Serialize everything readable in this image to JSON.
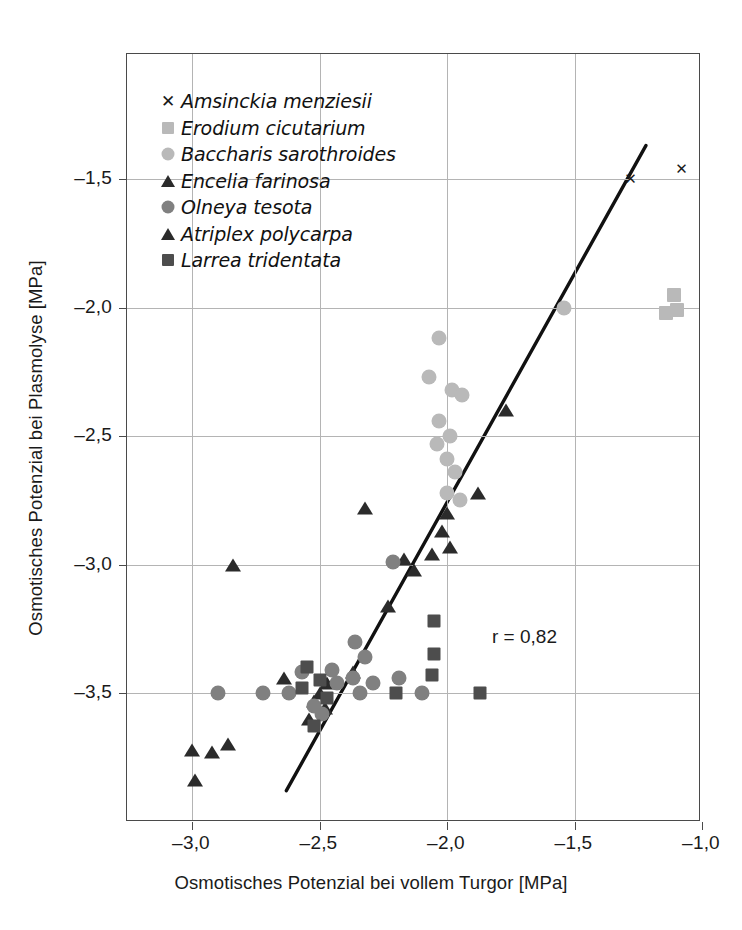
{
  "chart_data": {
    "type": "scatter",
    "title": "",
    "xlabel": "Osmotisches Potenzial bei vollem Turgor [MPa]",
    "ylabel": "Osmotisches Potenzial bei Plasmolyse [MPa]",
    "xlim": [
      -3.25,
      -1.0
    ],
    "ylim": [
      -3.95,
      -1.32
    ],
    "xticks": [
      -3.0,
      -2.5,
      -2.0,
      -1.5,
      -1.0
    ],
    "xticklabels": [
      "–3,0",
      "–2,5",
      "–2,0",
      "–1,5",
      "–1,0"
    ],
    "yticks": [
      -1.5,
      -2.0,
      -2.5,
      -3.0,
      -3.5
    ],
    "yticklabels": [
      "–1,5",
      "–2,0",
      "–2,5",
      "–3,0",
      "–3,5"
    ],
    "grid": true,
    "legend_position": "upper-left-inside",
    "annotations": [
      {
        "name": "correlation",
        "text": "r = 0,82",
        "x": -1.77,
        "y": -3.27
      }
    ],
    "trendline": {
      "name": "regression-line",
      "color": "#111111",
      "width": 3.4,
      "x0": -2.63,
      "y0": -3.88,
      "x1": -1.22,
      "y1": -1.37
    },
    "series": [
      {
        "name": "Amsinckia menziesii",
        "marker": "x",
        "color": "#1a1a1a",
        "size": 15,
        "points": [
          [
            -1.28,
            -1.5
          ],
          [
            -1.08,
            -1.46
          ]
        ]
      },
      {
        "name": "Erodium cicutarium",
        "marker": "square",
        "color": "#b9b9b9",
        "size": 14,
        "points": [
          [
            -1.11,
            -1.95
          ],
          [
            -1.14,
            -2.02
          ],
          [
            -1.1,
            -2.01
          ]
        ]
      },
      {
        "name": "Baccharis sarothroides",
        "marker": "circle",
        "color": "#b9b9b9",
        "size": 15,
        "points": [
          [
            -2.03,
            -2.12
          ],
          [
            -2.07,
            -2.27
          ],
          [
            -1.98,
            -2.32
          ],
          [
            -1.94,
            -2.34
          ],
          [
            -2.03,
            -2.44
          ],
          [
            -2.04,
            -2.53
          ],
          [
            -1.99,
            -2.5
          ],
          [
            -2.0,
            -2.59
          ],
          [
            -1.97,
            -2.64
          ],
          [
            -2.0,
            -2.72
          ],
          [
            -1.95,
            -2.75
          ],
          [
            -1.54,
            -2.0
          ]
        ]
      },
      {
        "name": "Encelia farinosa",
        "marker": "triangle",
        "color": "#2b2b2b",
        "size": 13,
        "points": [
          [
            -1.77,
            -2.4
          ],
          [
            -1.88,
            -2.72
          ],
          [
            -2.32,
            -2.78
          ],
          [
            -2.0,
            -2.8
          ],
          [
            -2.02,
            -2.87
          ],
          [
            -1.99,
            -2.93
          ],
          [
            -2.06,
            -2.96
          ],
          [
            -2.17,
            -2.98
          ],
          [
            -2.13,
            -3.02
          ],
          [
            -2.23,
            -3.16
          ],
          [
            -2.37,
            -3.42
          ],
          [
            -2.47,
            -3.46
          ],
          [
            -2.5,
            -3.5
          ],
          [
            -2.52,
            -3.53
          ],
          [
            -2.48,
            -3.56
          ],
          [
            -2.54,
            -3.6
          ]
        ]
      },
      {
        "name": "Olneya tesota",
        "marker": "circle",
        "color": "#808080",
        "size": 15,
        "points": [
          [
            -2.21,
            -2.99
          ],
          [
            -2.36,
            -3.3
          ],
          [
            -2.57,
            -3.42
          ],
          [
            -2.45,
            -3.41
          ],
          [
            -2.32,
            -3.36
          ],
          [
            -2.37,
            -3.44
          ],
          [
            -2.43,
            -3.46
          ],
          [
            -2.29,
            -3.46
          ],
          [
            -2.19,
            -3.44
          ],
          [
            -2.34,
            -3.5
          ],
          [
            -2.1,
            -3.5
          ],
          [
            -2.62,
            -3.5
          ],
          [
            -2.72,
            -3.5
          ],
          [
            -2.9,
            -3.5
          ],
          [
            -2.52,
            -3.55
          ],
          [
            -2.49,
            -3.58
          ]
        ]
      },
      {
        "name": "Atriplex polycarpa",
        "marker": "triangle",
        "color": "#2b2b2b",
        "size": 13,
        "points": [
          [
            -2.84,
            -3.0
          ],
          [
            -2.64,
            -3.44
          ],
          [
            -3.0,
            -3.72
          ],
          [
            -2.92,
            -3.73
          ],
          [
            -2.86,
            -3.7
          ],
          [
            -2.99,
            -3.84
          ]
        ]
      },
      {
        "name": "Larrea tridentata",
        "marker": "square",
        "color": "#4d4d4d",
        "size": 13,
        "points": [
          [
            -2.05,
            -3.22
          ],
          [
            -2.05,
            -3.35
          ],
          [
            -2.06,
            -3.43
          ],
          [
            -2.55,
            -3.4
          ],
          [
            -2.5,
            -3.45
          ],
          [
            -2.57,
            -3.48
          ],
          [
            -2.47,
            -3.52
          ],
          [
            -2.52,
            -3.63
          ],
          [
            -2.2,
            -3.5
          ],
          [
            -1.87,
            -3.5
          ]
        ]
      }
    ]
  },
  "legend": {
    "items": [
      {
        "label": "Amsinckia menziesii",
        "marker": "x",
        "color": "#1a1a1a"
      },
      {
        "label": "Erodium cicutarium",
        "marker": "square",
        "color": "#b9b9b9"
      },
      {
        "label": "Baccharis sarothroides",
        "marker": "circle",
        "color": "#b9b9b9"
      },
      {
        "label": "Encelia farinosa",
        "marker": "triangle",
        "color": "#2b2b2b"
      },
      {
        "label": "Olneya tesota",
        "marker": "circle",
        "color": "#808080"
      },
      {
        "label": "Atriplex polycarpa",
        "marker": "triangle",
        "color": "#2b2b2b"
      },
      {
        "label": "Larrea tridentata",
        "marker": "square",
        "color": "#4d4d4d"
      }
    ]
  }
}
